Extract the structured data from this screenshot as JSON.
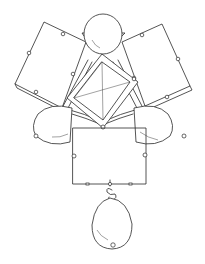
{
  "drawing": {
    "subject": "jewelry-pendant-sketch",
    "style": "pen line drawing",
    "stroke_color": "#2a2a2a",
    "background_color": "#ffffff",
    "components": {
      "top_pearl": "pearl",
      "left_panel": "square-plaque",
      "right_panel": "square-plaque",
      "center_gem": "square-cut-gem",
      "left_pearl": "pearl",
      "right_pearl": "pearl",
      "bottom_panel": "square-plaque",
      "drop_pearl": "pearl-drop"
    }
  }
}
